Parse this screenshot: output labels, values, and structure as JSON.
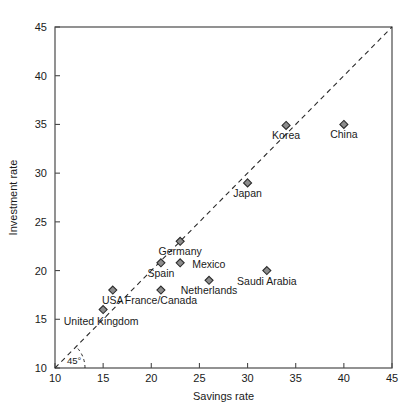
{
  "chart_data": {
    "type": "scatter",
    "title": "",
    "xlabel": "Savings rate",
    "ylabel": "Investment rate",
    "xlim": [
      10,
      45
    ],
    "ylim": [
      10,
      45
    ],
    "xticks": [
      10,
      15,
      20,
      25,
      30,
      35,
      40,
      45
    ],
    "yticks": [
      10,
      15,
      20,
      25,
      30,
      35,
      40,
      45
    ],
    "grid": false,
    "legend": null,
    "marker": "diamond",
    "marker_fill": "#8c8c8c",
    "marker_edge": "#2b2b2b",
    "points": [
      {
        "label": "United Kingdom",
        "x": 15,
        "y": 16,
        "label_dx": -2,
        "label_dy": 15,
        "anchor": "middle"
      },
      {
        "label": "USA",
        "x": 16,
        "y": 18,
        "label_dx": 0,
        "label_dy": 14,
        "anchor": "middle"
      },
      {
        "label": "France/Canada",
        "x": 21,
        "y": 18,
        "label_dx": 0,
        "label_dy": 14,
        "anchor": "middle"
      },
      {
        "label": "Spain",
        "x": 21,
        "y": 20.8,
        "label_dx": 0,
        "label_dy": 14,
        "anchor": "middle"
      },
      {
        "label": "Mexico",
        "x": 23,
        "y": 20.8,
        "label_dx": 12,
        "label_dy": 5,
        "anchor": "start"
      },
      {
        "label": "Germany",
        "x": 23,
        "y": 23,
        "label_dx": 0,
        "label_dy": 14,
        "anchor": "middle"
      },
      {
        "label": "Netherlands",
        "x": 26,
        "y": 19,
        "label_dx": 0,
        "label_dy": 14,
        "anchor": "middle"
      },
      {
        "label": "Saudi Arabia",
        "x": 32,
        "y": 20,
        "label_dx": 0,
        "label_dy": 14,
        "anchor": "middle"
      },
      {
        "label": "Japan",
        "x": 30,
        "y": 29,
        "label_dx": 0,
        "label_dy": 14,
        "anchor": "middle"
      },
      {
        "label": "Korea",
        "x": 34,
        "y": 34.9,
        "label_dx": 0,
        "label_dy": 14,
        "anchor": "middle"
      },
      {
        "label": "China",
        "x": 40,
        "y": 35,
        "label_dx": 0,
        "label_dy": 14,
        "anchor": "middle"
      }
    ],
    "reference_line": {
      "type": "45-degree",
      "style": "dashed",
      "from": [
        10,
        10
      ],
      "to": [
        45,
        45
      ],
      "annotation": "45°"
    }
  }
}
